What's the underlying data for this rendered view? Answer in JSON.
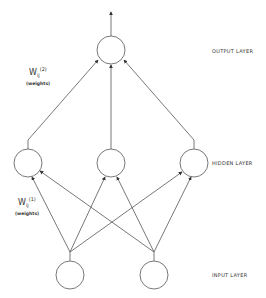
{
  "diagram": {
    "type": "neural-network",
    "layers": [
      {
        "name": "output",
        "label": "OUTPUT LAYER",
        "nodes": 1
      },
      {
        "name": "hidden",
        "label": "HIDDEN LAYER",
        "nodes": 3
      },
      {
        "name": "input",
        "label": "INPUT LAYER",
        "nodes": 2
      }
    ],
    "weights": [
      {
        "symbol": "W",
        "subscript": "ij",
        "superscript": "(2)",
        "note": "(weights)"
      },
      {
        "symbol": "W",
        "subscript": "ij",
        "superscript": "(1)",
        "note": "(weights)"
      }
    ],
    "connections": "fully connected input→hidden; hidden→output; output arrow upward"
  }
}
